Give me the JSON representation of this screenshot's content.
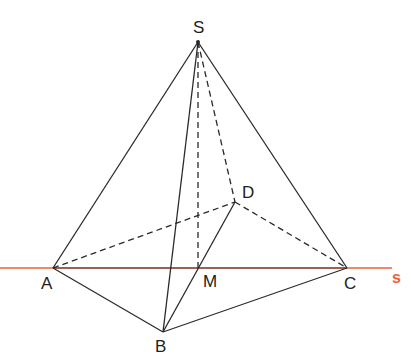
{
  "diagram": {
    "colors": {
      "edge": "#2a2a2a",
      "line_s_outer": "#e8643c",
      "line_s_inner": "#7a2a1a",
      "label_s": "#e8643c"
    },
    "points": {
      "S": {
        "x": 198,
        "y": 42,
        "label": "S",
        "lx": 193,
        "ly": 33
      },
      "A": {
        "x": 53,
        "y": 268,
        "label": "A",
        "lx": 41,
        "ly": 289
      },
      "B": {
        "x": 163,
        "y": 332,
        "label": "B",
        "lx": 155,
        "ly": 352
      },
      "C": {
        "x": 347,
        "y": 268,
        "label": "C",
        "lx": 344,
        "ly": 289
      },
      "D": {
        "x": 235,
        "y": 202,
        "label": "D",
        "lx": 242,
        "ly": 198
      },
      "M": {
        "x": 198,
        "y": 268,
        "label": "M",
        "lx": 203,
        "ly": 287
      }
    },
    "line_s": {
      "label": "s",
      "x1": 0,
      "x2": 392,
      "y": 268,
      "lx": 392,
      "ly": 283
    },
    "solid_edges": [
      [
        "S",
        "A"
      ],
      [
        "S",
        "B"
      ],
      [
        "S",
        "C"
      ],
      [
        "A",
        "B"
      ],
      [
        "B",
        "C"
      ],
      [
        "B",
        "D"
      ]
    ],
    "dashed_edges": [
      [
        "S",
        "M"
      ],
      [
        "S",
        "D"
      ],
      [
        "A",
        "D"
      ],
      [
        "D",
        "C"
      ]
    ]
  }
}
